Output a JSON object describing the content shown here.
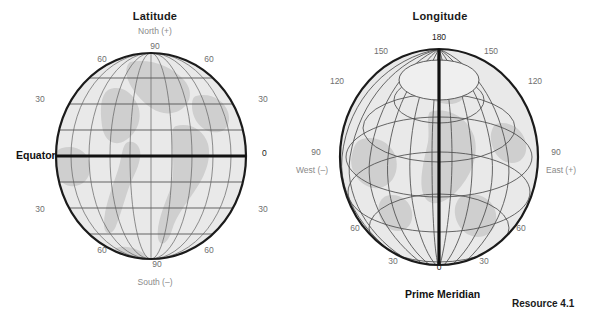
{
  "figure": {
    "caption": "Resource 4.1"
  },
  "globes": [
    {
      "id": "latitude-globe",
      "title": "Latitude",
      "pole_top_label": "North (+)",
      "pole_bottom_label": "South (–)",
      "main_axis_label": "Equator",
      "zero_label": "0",
      "ticks_left": [
        "60",
        "30",
        "30",
        "60"
      ],
      "ticks_right": [
        "60",
        "30",
        "30",
        "60"
      ],
      "tick_top": "90",
      "tick_bottom": "90",
      "parallels_deg": [
        0,
        15,
        30,
        45,
        60,
        75
      ],
      "bold_parallel_deg": 0
    },
    {
      "id": "longitude-globe",
      "title": "Longitude",
      "side_left_label": "West (–)",
      "side_right_label": "East (+)",
      "main_axis_label": "Prime Meridian",
      "zero_label": "0",
      "top_label": "180",
      "ticks_left": [
        "150",
        "120",
        "90",
        "60",
        "30"
      ],
      "ticks_right": [
        "150",
        "120",
        "90",
        "60",
        "30"
      ],
      "meridians_deg": [
        0,
        15,
        30,
        45,
        60,
        75,
        90,
        105,
        120,
        135,
        150,
        165,
        180
      ],
      "bold_meridian_deg": 0
    }
  ],
  "colors": {
    "sphere": "#e9e9e9",
    "land": "#cfcfcf",
    "grid": "#4d4d4d",
    "limb": "#1b1b1b",
    "bold": "#111111",
    "tick_text": "#6f6f6f",
    "title_text": "#1a1a1a"
  }
}
